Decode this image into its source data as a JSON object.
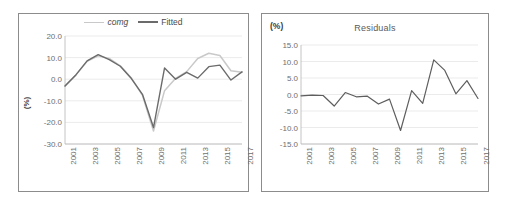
{
  "chart_data": [
    {
      "type": "line",
      "panel": "left",
      "title": "",
      "xlabel": "",
      "ylabel": "(%)",
      "ylim": [
        -30,
        20
      ],
      "yticks": [
        "20.0",
        "10.0",
        "0.0",
        "-10.0",
        "-20.0",
        "-30.0"
      ],
      "ytick_values": [
        20,
        10,
        0,
        -10,
        -20,
        -30
      ],
      "grid": true,
      "legend": [
        "comg",
        "Fitted"
      ],
      "legend_position": "top-center",
      "x": [
        2001,
        2002,
        2003,
        2004,
        2005,
        2006,
        2007,
        2008,
        2009,
        2010,
        2011,
        2012,
        2013,
        2014,
        2015,
        2016,
        2017
      ],
      "xtick_labels": [
        "2001",
        "2003",
        "2005",
        "2007",
        "2009",
        "2011",
        "2013",
        "2015",
        "2017"
      ],
      "xtick_values": [
        2001,
        2003,
        2005,
        2007,
        2009,
        2011,
        2013,
        2015,
        2017
      ],
      "series": [
        {
          "name": "comg",
          "color": "#c9c9c9",
          "values": [
            -3.2,
            2.0,
            8.3,
            10.8,
            9.6,
            6.2,
            0.6,
            -7.5,
            -24.0,
            -5.3,
            0.4,
            3.5,
            9.6,
            12.0,
            11.0,
            3.9,
            3.2
          ]
        },
        {
          "name": "Fitted",
          "color": "#6b6b6b",
          "values": [
            -3.1,
            2.1,
            8.5,
            11.4,
            9.1,
            6.0,
            0.3,
            -7.0,
            -22.4,
            5.2,
            0.0,
            3.2,
            0.5,
            5.8,
            6.5,
            -0.4,
            3.4
          ]
        }
      ]
    },
    {
      "type": "line",
      "panel": "right",
      "title": "Residuals",
      "xlabel": "",
      "ylabel": "(%)",
      "ylim": [
        -15,
        15
      ],
      "yticks": [
        "15.0",
        "10.0",
        "5.0",
        "0.0",
        "-5.0",
        "-10.0",
        "-15.0"
      ],
      "ytick_values": [
        15,
        10,
        5,
        0,
        -5,
        -10,
        -15
      ],
      "grid": true,
      "legend": [],
      "x": [
        2001,
        2002,
        2003,
        2004,
        2005,
        2006,
        2007,
        2008,
        2009,
        2010,
        2011,
        2012,
        2013,
        2014,
        2015,
        2016,
        2017
      ],
      "xtick_labels": [
        "2001",
        "2003",
        "2005",
        "2007",
        "2009",
        "2011",
        "2013",
        "2015",
        "2017"
      ],
      "xtick_values": [
        2001,
        2003,
        2005,
        2007,
        2009,
        2011,
        2013,
        2015,
        2017
      ],
      "series": [
        {
          "name": "Residuals",
          "color": "#5e5e5e",
          "values": [
            -0.4,
            -0.2,
            -0.3,
            -3.5,
            0.6,
            -0.7,
            -0.5,
            -2.9,
            -1.4,
            -10.9,
            1.2,
            -2.7,
            10.5,
            7.3,
            0.2,
            4.2,
            -1.2
          ]
        }
      ]
    }
  ],
  "left_panel": {
    "unit_label": "(%)",
    "legend": {
      "comg_label": "comg",
      "fitted_label": "Fitted",
      "comg_color": "#c9c9c9",
      "fitted_color": "#6b6b6b"
    }
  },
  "right_panel": {
    "unit_label": "(%)",
    "title": "Residuals"
  }
}
